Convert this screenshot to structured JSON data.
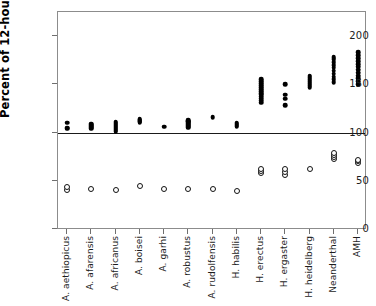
{
  "chart_data": {
    "type": "scatter",
    "title": "",
    "xlabel": "",
    "ylabel": "Percent of 12-hour day",
    "ylim": [
      0,
      220
    ],
    "yticks": [
      0,
      50,
      100,
      150,
      200
    ],
    "ytick_labels": [
      "0",
      "50",
      "100",
      "150",
      "200"
    ],
    "grid": false,
    "legend": "none",
    "reference_line": {
      "value": 100,
      "label": "100"
    },
    "categories": [
      "A. aethiopicus",
      "A. afarensis",
      "A. africanus",
      "A. boisei",
      "A. garhi",
      "A. robustus",
      "A. rudolfensis",
      "H. habilis",
      "H. erectus",
      "H. ergaster",
      "H. heidelberg",
      "Neanderthal",
      "AMH"
    ],
    "series": [
      {
        "name": "upper",
        "marker": "filled-circle",
        "values": [
          [
            104,
            105,
            110
          ],
          [
            104,
            105,
            106,
            107,
            108,
            109
          ],
          [
            101,
            102,
            103,
            104,
            105,
            106,
            107,
            108,
            109,
            110,
            111
          ],
          [
            110,
            111,
            112,
            113,
            114
          ],
          [
            106
          ],
          [
            105,
            106,
            107,
            108,
            109,
            110,
            111,
            112,
            113
          ],
          [
            116
          ],
          [
            106,
            107,
            108,
            109,
            110
          ],
          [
            131,
            133,
            135,
            137,
            139,
            141,
            143,
            145,
            147,
            149,
            151,
            153,
            155
          ],
          [
            128,
            135,
            139,
            150
          ],
          [
            147,
            149,
            151,
            153,
            155,
            157,
            159
          ],
          [
            152,
            155,
            158,
            161,
            164,
            167,
            170,
            173,
            176,
            178
          ],
          [
            150,
            153,
            156,
            159,
            162,
            165,
            168,
            171,
            174,
            177,
            180,
            183
          ]
        ]
      },
      {
        "name": "lower",
        "marker": "open-circle",
        "values": [
          [
            40,
            44
          ],
          [
            41
          ],
          [
            40
          ],
          [
            45
          ],
          [
            41
          ],
          [
            41
          ],
          [
            41
          ],
          [
            39
          ],
          [
            58,
            60,
            62
          ],
          [
            56,
            59,
            62
          ],
          [
            62
          ],
          [
            73,
            75,
            77,
            79
          ],
          [
            68,
            70,
            72
          ]
        ]
      }
    ]
  }
}
